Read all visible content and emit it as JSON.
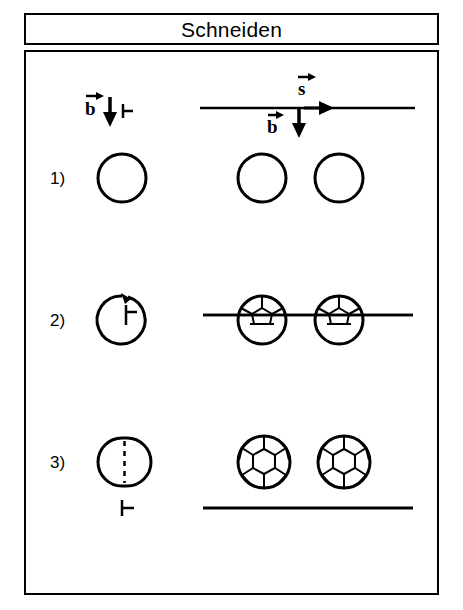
{
  "figure": {
    "title": "Schneiden",
    "caption_box_present": true
  },
  "annotations": {
    "left_group": {
      "vector_label": "b",
      "vector_accent": "arrow-right",
      "direction_arrow": "down",
      "tick_mark": "width-tick"
    },
    "right_group": {
      "cut_vector_label": "s",
      "cut_vector_accent": "arrow-right",
      "cut_direction_arrow": "right",
      "feed_vector_label": "b",
      "feed_vector_accent": "arrow-right",
      "feed_direction_arrow": "down"
    }
  },
  "rows": [
    {
      "label": "1)",
      "stage": 1,
      "left_shape": "plain-circle",
      "right_shapes": [
        "plain-circle",
        "plain-circle"
      ],
      "line_position": "above-circles",
      "pattern": "none"
    },
    {
      "label": "2)",
      "stage": 2,
      "left_shape": "circle-with-curved-arrow-and-tick",
      "right_shapes": [
        "circle-partial-hexagon-top",
        "circle-partial-hexagon-top"
      ],
      "line_position": "through-circles",
      "pattern": "partial-hexagonal"
    },
    {
      "label": "3)",
      "stage": 3,
      "left_shape": "circle-split-dashed",
      "right_shapes": [
        "circle-full-hexagon",
        "circle-full-hexagon"
      ],
      "line_position": "below-circles",
      "pattern": "full-hexagonal",
      "tick_mark": "width-tick"
    }
  ],
  "colors": {
    "stroke": "#000000",
    "background": "#ffffff"
  }
}
